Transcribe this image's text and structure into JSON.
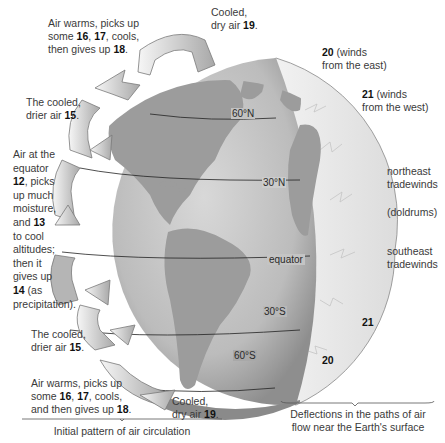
{
  "diagram": {
    "left_labels": {
      "top_warm": {
        "pre": "Air warms, picks up",
        "line2a": "some ",
        "n16": "16",
        "sep1": ", ",
        "n17": "17",
        "line2b": ", cools,",
        "line3a": "then gives up ",
        "n18": "18",
        "end": "."
      },
      "top_cooled_drier": {
        "line1": "The cooled,",
        "line2a": "drier air ",
        "n15": "15",
        "end": "."
      },
      "equator_air": {
        "l1": "Air at the",
        "l2": "equator",
        "n12": "12",
        "l3": ", picks",
        "l4": "up much",
        "l5": "moisture,",
        "l6a": "and ",
        "n13": "13",
        "l7": "to cool",
        "l8": "altitudes;",
        "l9": "then it",
        "l10": "gives up",
        "n14": "14",
        "l11": " (as",
        "l12": "precipitation)."
      },
      "bottom_cooled_drier": {
        "line1": "The cooled,",
        "line2a": "drier air ",
        "n15": "15",
        "end": "."
      },
      "bottom_warm": {
        "pre": "Air warms, picks up",
        "line2a": "some ",
        "n16": "16",
        "sep1": ", ",
        "n17": "17",
        "line2b": ", cools,",
        "line3a": "and then gives up ",
        "n18": "18",
        "end": "."
      },
      "bottom_cooled_dry": {
        "line1": "Cooled,",
        "line2a": "dry air ",
        "n19": "19",
        "end": "."
      }
    },
    "top_cooled_dry": {
      "line1": "Cooled,",
      "line2a": "dry air ",
      "n19": "19",
      "end": "."
    },
    "right_labels": {
      "winds_east": {
        "num": "20",
        "l1": " (winds",
        "l2": "from the east)"
      },
      "winds_west": {
        "num": "21",
        "l1": " (winds",
        "l2": "from the west)"
      },
      "ne_trades": {
        "l1": "northeast",
        "l2": "tradewinds"
      },
      "doldrums": "(doldrums)",
      "se_trades": {
        "l1": "southeast",
        "l2": "tradewinds"
      },
      "num21_south": "21",
      "num20_south": "20"
    },
    "latitudes": {
      "n60": "60°N",
      "n30": "30°N",
      "equator": "equator",
      "s30": "30°S",
      "s60": "60°S"
    },
    "captions": {
      "left": "Initial pattern of air circulation",
      "right_l1": "Deflections in the paths of air",
      "right_l2": "flow near the Earth's surface"
    },
    "colors": {
      "ocean": "#c9c9c9",
      "land": "#9a9a9a",
      "slice": "#e6e6e6",
      "arrow": "#efefef",
      "text": "#3a3a3a"
    }
  }
}
